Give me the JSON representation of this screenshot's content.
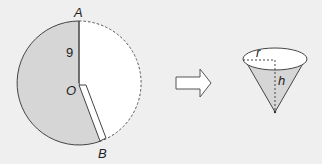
{
  "sector": {
    "label_top": "A",
    "label_center": "O",
    "label_bottom": "B",
    "radius_label": "9"
  },
  "arrow": {
    "direction": "right"
  },
  "cone": {
    "radius_label": "r",
    "height_label": "h"
  },
  "colors": {
    "background": "#efefef",
    "shaded": "#d6d6d6",
    "white": "#ffffff",
    "stroke": "#444444"
  }
}
